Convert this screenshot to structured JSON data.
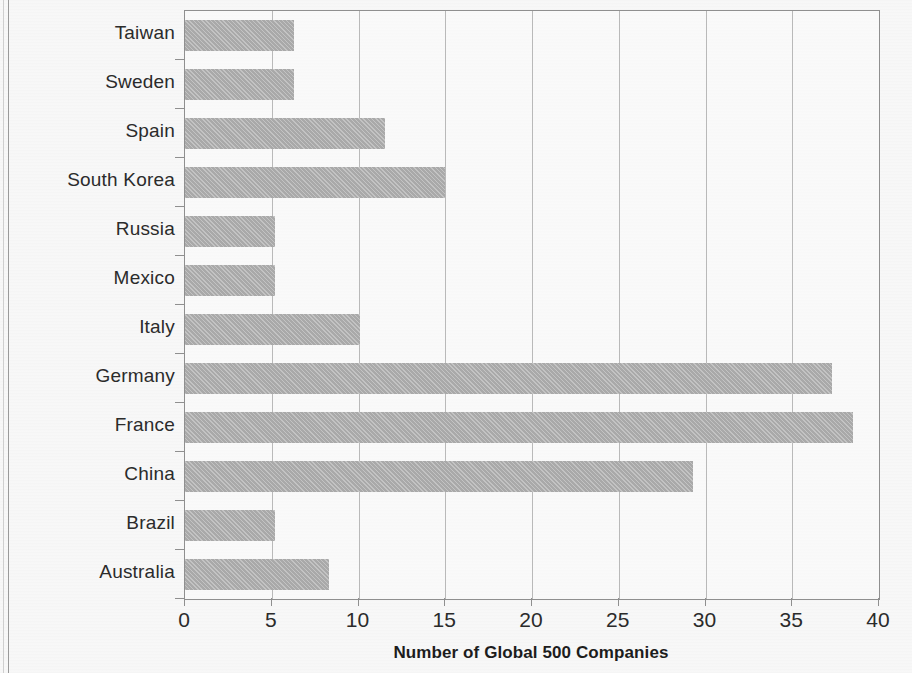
{
  "chart_data": {
    "type": "bar",
    "orientation": "horizontal",
    "title": "",
    "xlabel": "Number of Global 500 Companies",
    "ylabel": "",
    "xlim": [
      0,
      40
    ],
    "xticks": [
      "0",
      "5",
      "10",
      "15",
      "20",
      "25",
      "30",
      "35",
      "40"
    ],
    "xtick_values": [
      0,
      5,
      10,
      15,
      20,
      25,
      30,
      35,
      40
    ],
    "grid": true,
    "legend": null,
    "bar_color": "#a9a9a9",
    "categories": [
      "Taiwan",
      "Sweden",
      "Spain",
      "South Korea",
      "Russia",
      "Mexico",
      "Italy",
      "Germany",
      "France",
      "China",
      "Brazil",
      "Australia"
    ],
    "values": [
      6.3,
      6.3,
      11.5,
      15.0,
      5.2,
      5.2,
      10.1,
      37.3,
      38.5,
      29.3,
      5.2,
      8.3
    ]
  }
}
